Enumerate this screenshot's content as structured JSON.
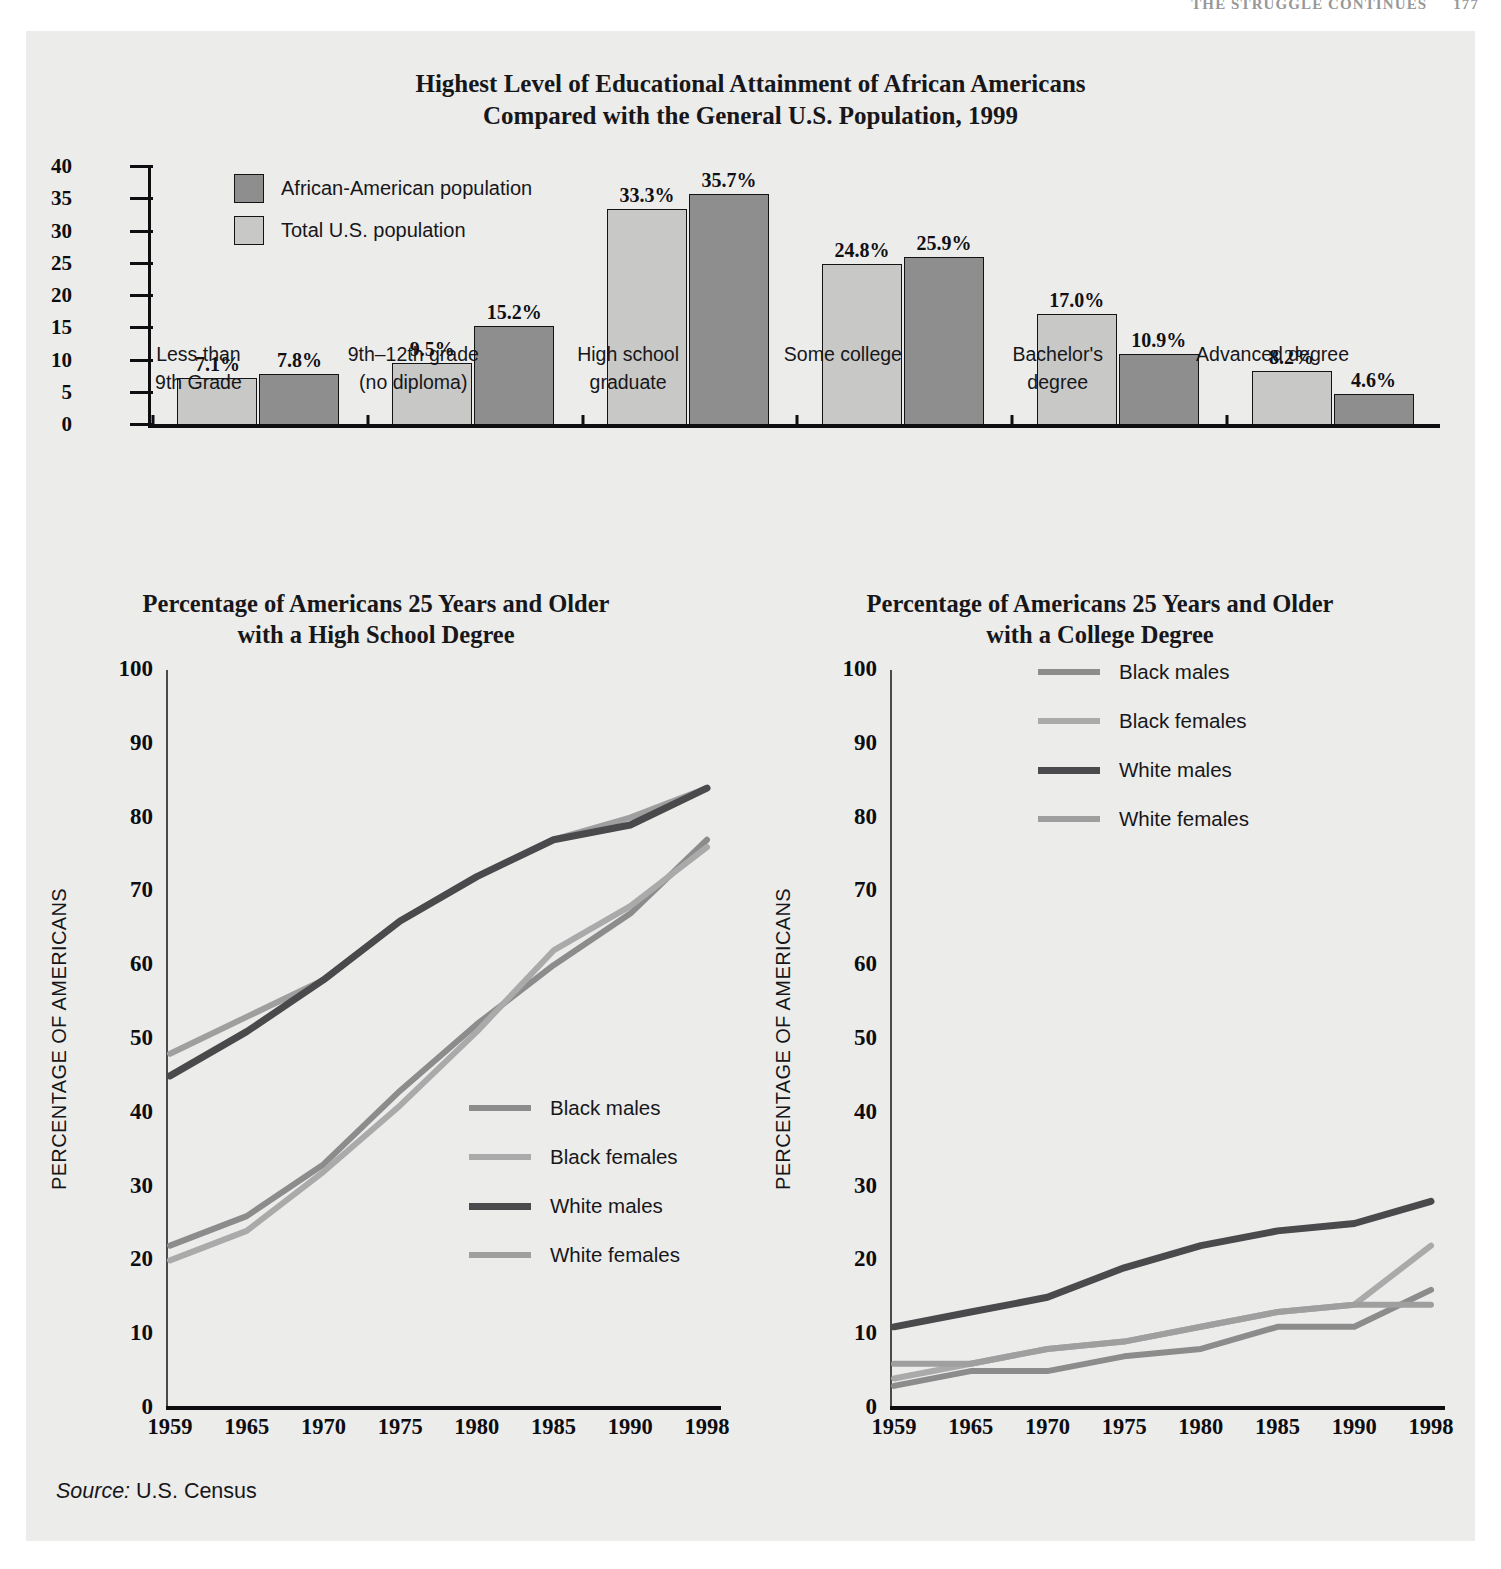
{
  "running_head": {
    "text": "THE STRUGGLE CONTINUES",
    "page_number": "177"
  },
  "source_note": {
    "label": "Source:",
    "value": "U.S. Census"
  },
  "bar_chart": {
    "title_line1": "Highest Level of Educational Attainment of African Americans",
    "title_line2": "Compared with the General U.S. Population, 1999",
    "legend": [
      {
        "label": "African-American population",
        "color": "#8e8e8e"
      },
      {
        "label": "Total U.S. population",
        "color": "#c8c8c7"
      }
    ]
  },
  "line_chart_left": {
    "title_line1": "Percentage of Americans 25 Years and Older",
    "title_line2": "with a High School Degree",
    "axis_title": "PERCENTAGE OF AMERICANS"
  },
  "line_chart_right": {
    "title_line1": "Percentage of Americans 25 Years and Older",
    "title_line2": "with a College Degree",
    "axis_title": "PERCENTAGE OF AMERICANS"
  },
  "chart_data": [
    {
      "type": "bar",
      "title": "Highest Level of Educational Attainment of African Americans Compared with the General U.S. Population, 1999",
      "xlabel": "",
      "ylabel": "",
      "ylim": [
        0,
        40
      ],
      "yticks": [
        0,
        5,
        10,
        15,
        20,
        25,
        30,
        35,
        40
      ],
      "grid": false,
      "legend_position": "top-left",
      "categories": [
        "Less than\n9th Grade",
        "9th–12th grade\n(no diploma)",
        "High school\ngraduate",
        "Some college",
        "Bachelor's\ndegree",
        "Advanced degree"
      ],
      "category_lines": [
        [
          "Less than",
          "9th Grade"
        ],
        [
          "9th–12th grade",
          "(no diploma)"
        ],
        [
          "High school",
          "graduate"
        ],
        [
          "Some college",
          ""
        ],
        [
          "Bachelor's",
          "degree"
        ],
        [
          "Advanced degree",
          ""
        ]
      ],
      "series": [
        {
          "name": "Total U.S. population",
          "color": "#c8c8c7",
          "values": [
            7.1,
            9.5,
            33.3,
            24.8,
            17.0,
            8.2
          ],
          "labels": [
            "7.1%",
            "9.5%",
            "33.3%",
            "24.8%",
            "17.0%",
            "8.2%"
          ]
        },
        {
          "name": "African-American population",
          "color": "#8e8e8e",
          "values": [
            7.8,
            15.2,
            35.7,
            25.9,
            10.9,
            4.6
          ],
          "labels": [
            "7.8%",
            "15.2%",
            "35.7%",
            "25.9%",
            "10.9%",
            "4.6%"
          ]
        }
      ]
    },
    {
      "type": "line",
      "title": "Percentage of Americans 25 Years and Older with a High School Degree",
      "xlabel": "",
      "ylabel": "PERCENTAGE OF AMERICANS",
      "ylim": [
        0,
        100
      ],
      "yticks": [
        0,
        10,
        20,
        30,
        40,
        50,
        60,
        70,
        80,
        90,
        100
      ],
      "x": [
        "1959",
        "1965",
        "1970",
        "1975",
        "1980",
        "1985",
        "1990",
        "1998"
      ],
      "grid": false,
      "legend_position": "inside-lower-right",
      "series": [
        {
          "name": "Black males",
          "color": "#8c8c8c",
          "values": [
            22,
            26,
            33,
            43,
            52,
            60,
            67,
            77
          ]
        },
        {
          "name": "Black females",
          "color": "#aaaaaa",
          "values": [
            20,
            24,
            32,
            41,
            51,
            62,
            68,
            76
          ]
        },
        {
          "name": "White males",
          "color": "#4a4a4c",
          "values": [
            45,
            51,
            58,
            66,
            72,
            77,
            79,
            84
          ]
        },
        {
          "name": "White females",
          "color": "#9f9f9f",
          "values": [
            48,
            53,
            58,
            66,
            72,
            77,
            80,
            84
          ]
        }
      ]
    },
    {
      "type": "line",
      "title": "Percentage of Americans 25 Years and Older with a College Degree",
      "xlabel": "",
      "ylabel": "PERCENTAGE OF AMERICANS",
      "ylim": [
        0,
        100
      ],
      "yticks": [
        0,
        10,
        20,
        30,
        40,
        50,
        60,
        70,
        80,
        90,
        100
      ],
      "x": [
        "1959",
        "1965",
        "1970",
        "1975",
        "1980",
        "1985",
        "1990",
        "1998"
      ],
      "grid": false,
      "legend_position": "inside-upper-right",
      "series": [
        {
          "name": "Black males",
          "color": "#8c8c8c",
          "values": [
            3,
            5,
            5,
            7,
            8,
            11,
            11,
            16
          ]
        },
        {
          "name": "Black females",
          "color": "#aaaaaa",
          "values": [
            4,
            6,
            8,
            9,
            11,
            13,
            14,
            22
          ]
        },
        {
          "name": "White males",
          "color": "#4a4a4c",
          "values": [
            11,
            13,
            15,
            19,
            22,
            24,
            25,
            28
          ]
        },
        {
          "name": "White females",
          "color": "#9f9f9f",
          "values": [
            6,
            6,
            8,
            9,
            11,
            13,
            14,
            14
          ]
        }
      ]
    }
  ],
  "line_legend": [
    {
      "label": "Black males",
      "color": "#8c8c8c",
      "width": 6
    },
    {
      "label": "Black females",
      "color": "#aaaaaa",
      "width": 6
    },
    {
      "label": "White males",
      "color": "#4a4a4c",
      "width": 7
    },
    {
      "label": "White females",
      "color": "#9f9f9f",
      "width": 6
    }
  ]
}
